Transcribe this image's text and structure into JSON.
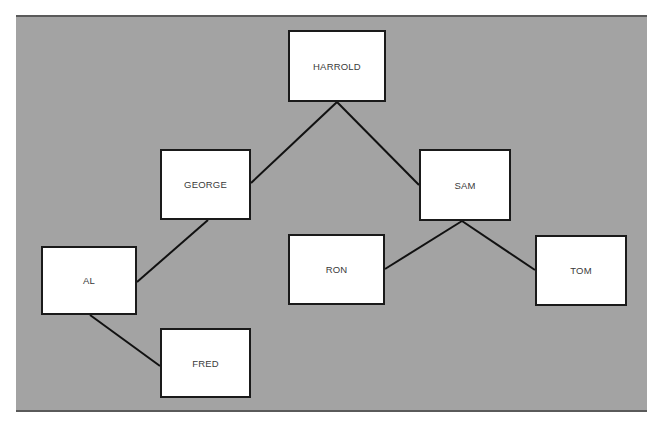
{
  "diagram": {
    "type": "tree",
    "background_color": "#a3a3a3",
    "node_fill": "#ffffff",
    "line_color": "#111111",
    "nodes": [
      {
        "id": "harrold",
        "label": "HARROLD",
        "x": 288,
        "y": 30,
        "w": 98,
        "h": 72
      },
      {
        "id": "george",
        "label": "GEORGE",
        "x": 160,
        "y": 149,
        "w": 91,
        "h": 71
      },
      {
        "id": "sam",
        "label": "SAM",
        "x": 419,
        "y": 149,
        "w": 92,
        "h": 72
      },
      {
        "id": "al",
        "label": "AL",
        "x": 41,
        "y": 246,
        "w": 96,
        "h": 69
      },
      {
        "id": "ron",
        "label": "RON",
        "x": 288,
        "y": 234,
        "w": 97,
        "h": 71
      },
      {
        "id": "tom",
        "label": "TOM",
        "x": 535,
        "y": 235,
        "w": 92,
        "h": 71
      },
      {
        "id": "fred",
        "label": "FRED",
        "x": 160,
        "y": 328,
        "w": 91,
        "h": 70
      }
    ],
    "edges": [
      {
        "from": "harrold",
        "to": "george",
        "x1": 337,
        "y1": 102,
        "x2": 251,
        "y2": 183
      },
      {
        "from": "harrold",
        "to": "sam",
        "x1": 337,
        "y1": 102,
        "x2": 419,
        "y2": 185
      },
      {
        "from": "george",
        "to": "al",
        "x1": 208,
        "y1": 220,
        "x2": 137,
        "y2": 282
      },
      {
        "from": "al",
        "to": "fred",
        "x1": 90,
        "y1": 315,
        "x2": 160,
        "y2": 366
      },
      {
        "from": "sam",
        "to": "ron",
        "x1": 462,
        "y1": 221,
        "x2": 385,
        "y2": 269
      },
      {
        "from": "sam",
        "to": "tom",
        "x1": 462,
        "y1": 221,
        "x2": 535,
        "y2": 270
      }
    ]
  }
}
